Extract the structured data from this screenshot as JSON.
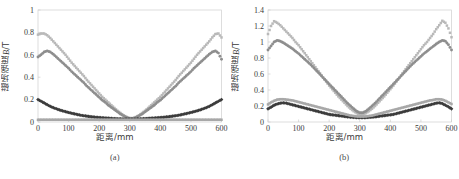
{
  "figure": {
    "background": "#ffffff",
    "frame_color": "#cfcfcf",
    "axis_text_color": "#3a3a3a"
  },
  "chart_data": [
    {
      "type": "scatter",
      "panel": "a",
      "caption": "(a)",
      "title": "",
      "xlabel": "距离/mm",
      "ylabel": "磁场强度B/T",
      "ylabel_main": "磁场强度",
      "ylabel_italic": "B",
      "ylabel_unit": "/T",
      "xlim": [
        0,
        600
      ],
      "ylim": [
        0,
        1
      ],
      "xticks": [
        0,
        100,
        200,
        300,
        400,
        500,
        600
      ],
      "xtick_labels": [
        "0",
        "100",
        "200",
        "300",
        "400",
        "500",
        "600"
      ],
      "yticks": [
        0,
        0.2,
        0.4,
        0.6,
        0.8,
        1
      ],
      "ytick_labels": [
        "0",
        "0.2",
        "0.4",
        "0.6",
        "0.8",
        "1"
      ],
      "grid": false,
      "legend_position": "none",
      "x": [
        0,
        10,
        20,
        30,
        40,
        50,
        60,
        70,
        80,
        90,
        100,
        110,
        120,
        130,
        140,
        150,
        160,
        170,
        180,
        190,
        200,
        210,
        220,
        230,
        240,
        250,
        260,
        270,
        280,
        290,
        300,
        310,
        320,
        330,
        340,
        350,
        360,
        370,
        380,
        390,
        400,
        410,
        420,
        430,
        440,
        450,
        460,
        470,
        480,
        490,
        500,
        510,
        520,
        530,
        540,
        550,
        560,
        570,
        580,
        590,
        600
      ],
      "series": [
        {
          "name": "series-1-light",
          "color": "#b9b9b9",
          "marker": "square",
          "values": [
            0.78,
            0.79,
            0.79,
            0.775,
            0.75,
            0.72,
            0.69,
            0.66,
            0.63,
            0.6,
            0.565,
            0.53,
            0.5,
            0.47,
            0.44,
            0.41,
            0.375,
            0.345,
            0.315,
            0.285,
            0.255,
            0.225,
            0.2,
            0.175,
            0.15,
            0.125,
            0.1,
            0.08,
            0.06,
            0.045,
            0.035,
            0.035,
            0.045,
            0.06,
            0.08,
            0.1,
            0.125,
            0.15,
            0.175,
            0.2,
            0.225,
            0.255,
            0.285,
            0.315,
            0.345,
            0.375,
            0.41,
            0.44,
            0.47,
            0.5,
            0.53,
            0.565,
            0.6,
            0.63,
            0.66,
            0.69,
            0.72,
            0.755,
            0.785,
            0.79,
            0.755
          ]
        },
        {
          "name": "series-2-mid",
          "color": "#8e8e8e",
          "marker": "circle",
          "values": [
            0.58,
            0.6,
            0.625,
            0.635,
            0.625,
            0.605,
            0.58,
            0.555,
            0.53,
            0.505,
            0.48,
            0.45,
            0.425,
            0.4,
            0.375,
            0.35,
            0.32,
            0.295,
            0.27,
            0.245,
            0.22,
            0.195,
            0.175,
            0.15,
            0.13,
            0.11,
            0.09,
            0.07,
            0.055,
            0.04,
            0.03,
            0.03,
            0.04,
            0.055,
            0.07,
            0.09,
            0.11,
            0.13,
            0.15,
            0.175,
            0.195,
            0.22,
            0.245,
            0.27,
            0.295,
            0.32,
            0.35,
            0.375,
            0.4,
            0.425,
            0.45,
            0.48,
            0.505,
            0.53,
            0.555,
            0.58,
            0.605,
            0.625,
            0.635,
            0.615,
            0.56
          ]
        },
        {
          "name": "series-3-dark",
          "color": "#3c3c3c",
          "marker": "diamond",
          "values": [
            0.2,
            0.185,
            0.17,
            0.155,
            0.14,
            0.128,
            0.118,
            0.108,
            0.1,
            0.092,
            0.085,
            0.078,
            0.072,
            0.066,
            0.06,
            0.056,
            0.052,
            0.048,
            0.045,
            0.042,
            0.04,
            0.038,
            0.036,
            0.034,
            0.032,
            0.03,
            0.029,
            0.028,
            0.027,
            0.026,
            0.026,
            0.026,
            0.027,
            0.028,
            0.029,
            0.03,
            0.032,
            0.034,
            0.036,
            0.038,
            0.04,
            0.042,
            0.045,
            0.048,
            0.052,
            0.056,
            0.06,
            0.066,
            0.072,
            0.078,
            0.085,
            0.092,
            0.1,
            0.108,
            0.118,
            0.128,
            0.14,
            0.155,
            0.17,
            0.185,
            0.2
          ]
        },
        {
          "name": "series-4-flat",
          "color": "#a8a8a8",
          "marker": "square",
          "values": [
            0.02,
            0.02,
            0.02,
            0.02,
            0.02,
            0.02,
            0.02,
            0.02,
            0.02,
            0.02,
            0.02,
            0.02,
            0.02,
            0.02,
            0.02,
            0.02,
            0.02,
            0.02,
            0.02,
            0.02,
            0.02,
            0.02,
            0.02,
            0.02,
            0.02,
            0.02,
            0.02,
            0.02,
            0.02,
            0.02,
            0.02,
            0.02,
            0.02,
            0.02,
            0.02,
            0.02,
            0.02,
            0.02,
            0.02,
            0.02,
            0.02,
            0.02,
            0.02,
            0.02,
            0.02,
            0.02,
            0.02,
            0.02,
            0.02,
            0.02,
            0.02,
            0.02,
            0.02,
            0.02,
            0.02,
            0.02,
            0.02,
            0.02,
            0.02,
            0.02,
            0.02
          ]
        }
      ]
    },
    {
      "type": "scatter",
      "panel": "b",
      "caption": "(b)",
      "title": "",
      "xlabel": "距离/mm",
      "ylabel": "磁场强度B/T",
      "ylabel_main": "磁场强度",
      "ylabel_italic": "B",
      "ylabel_unit": "/T",
      "xlim": [
        0,
        600
      ],
      "ylim": [
        0,
        1.4
      ],
      "xticks": [
        0,
        100,
        200,
        300,
        400,
        500,
        600
      ],
      "xtick_labels": [
        "0",
        "100",
        "200",
        "300",
        "400",
        "500",
        "600"
      ],
      "yticks": [
        0,
        0.2,
        0.4,
        0.6,
        0.8,
        1,
        1.2,
        1.4
      ],
      "ytick_labels": [
        "0",
        "0.2",
        "0.4",
        "0.6",
        "0.8",
        "1",
        "1.2",
        "1.4"
      ],
      "grid": false,
      "legend_position": "none",
      "x": [
        0,
        10,
        20,
        30,
        40,
        50,
        60,
        70,
        80,
        90,
        100,
        110,
        120,
        130,
        140,
        150,
        160,
        170,
        180,
        190,
        200,
        210,
        220,
        230,
        240,
        250,
        260,
        270,
        280,
        290,
        300,
        310,
        320,
        330,
        340,
        350,
        360,
        370,
        380,
        390,
        400,
        410,
        420,
        430,
        440,
        450,
        460,
        470,
        480,
        490,
        500,
        510,
        520,
        530,
        540,
        550,
        560,
        570,
        580,
        590,
        600
      ],
      "series": [
        {
          "name": "series-1-light",
          "color": "#b9b9b9",
          "marker": "square",
          "values": [
            1.1,
            1.2,
            1.26,
            1.24,
            1.21,
            1.17,
            1.13,
            1.09,
            1.05,
            1.0,
            0.96,
            0.91,
            0.86,
            0.81,
            0.76,
            0.71,
            0.66,
            0.61,
            0.555,
            0.505,
            0.455,
            0.41,
            0.365,
            0.32,
            0.28,
            0.24,
            0.2,
            0.165,
            0.135,
            0.11,
            0.095,
            0.095,
            0.11,
            0.135,
            0.165,
            0.2,
            0.24,
            0.28,
            0.32,
            0.365,
            0.41,
            0.455,
            0.505,
            0.555,
            0.61,
            0.66,
            0.71,
            0.76,
            0.81,
            0.86,
            0.91,
            0.96,
            1.0,
            1.05,
            1.1,
            1.16,
            1.21,
            1.265,
            1.24,
            1.17,
            1.06
          ]
        },
        {
          "name": "series-2-mid",
          "color": "#8e8e8e",
          "marker": "circle",
          "values": [
            0.9,
            0.95,
            1.0,
            1.02,
            1.01,
            0.99,
            0.965,
            0.94,
            0.915,
            0.885,
            0.855,
            0.82,
            0.785,
            0.75,
            0.715,
            0.675,
            0.635,
            0.595,
            0.555,
            0.515,
            0.475,
            0.435,
            0.395,
            0.355,
            0.315,
            0.275,
            0.235,
            0.2,
            0.165,
            0.135,
            0.115,
            0.115,
            0.135,
            0.165,
            0.2,
            0.235,
            0.275,
            0.315,
            0.355,
            0.395,
            0.435,
            0.475,
            0.515,
            0.555,
            0.595,
            0.635,
            0.675,
            0.715,
            0.75,
            0.785,
            0.82,
            0.855,
            0.885,
            0.915,
            0.945,
            0.975,
            1.0,
            1.02,
            1.01,
            0.965,
            0.9
          ]
        },
        {
          "name": "series-3-dark",
          "color": "#3c3c3c",
          "marker": "diamond",
          "values": [
            0.165,
            0.185,
            0.21,
            0.225,
            0.235,
            0.24,
            0.235,
            0.225,
            0.215,
            0.205,
            0.195,
            0.185,
            0.175,
            0.165,
            0.155,
            0.145,
            0.135,
            0.125,
            0.115,
            0.105,
            0.095,
            0.09,
            0.085,
            0.08,
            0.075,
            0.07,
            0.065,
            0.06,
            0.058,
            0.055,
            0.055,
            0.055,
            0.055,
            0.058,
            0.06,
            0.065,
            0.07,
            0.075,
            0.08,
            0.085,
            0.09,
            0.095,
            0.105,
            0.115,
            0.125,
            0.135,
            0.145,
            0.155,
            0.165,
            0.175,
            0.185,
            0.195,
            0.205,
            0.215,
            0.225,
            0.235,
            0.24,
            0.23,
            0.21,
            0.19,
            0.165
          ]
        },
        {
          "name": "series-4-gray",
          "color": "#a8a8a8",
          "marker": "square",
          "values": [
            0.22,
            0.245,
            0.265,
            0.28,
            0.285,
            0.285,
            0.28,
            0.275,
            0.27,
            0.26,
            0.25,
            0.24,
            0.23,
            0.22,
            0.21,
            0.2,
            0.19,
            0.18,
            0.17,
            0.16,
            0.15,
            0.14,
            0.13,
            0.12,
            0.11,
            0.1,
            0.09,
            0.08,
            0.075,
            0.07,
            0.068,
            0.068,
            0.07,
            0.075,
            0.08,
            0.09,
            0.1,
            0.11,
            0.12,
            0.13,
            0.14,
            0.15,
            0.16,
            0.17,
            0.18,
            0.19,
            0.2,
            0.21,
            0.22,
            0.23,
            0.24,
            0.25,
            0.26,
            0.27,
            0.275,
            0.285,
            0.285,
            0.28,
            0.265,
            0.245,
            0.225
          ]
        }
      ]
    }
  ]
}
